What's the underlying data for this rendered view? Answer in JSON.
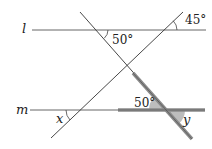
{
  "diagram": {
    "title": "",
    "colors": {
      "line": "#333333",
      "thin_line": "#555555",
      "highlight": "#888888",
      "shade": "#b8b8b8",
      "text": "#222222",
      "background": "#ffffff"
    },
    "lines": {
      "l": {
        "label": "l",
        "y": 30,
        "x1": 32,
        "x2": 206
      },
      "m": {
        "label": "m",
        "y": 110,
        "x1": 30,
        "x2": 205
      }
    },
    "transversals": [
      {
        "name": "descending",
        "x1": 80,
        "y1": 12,
        "x2": 192,
        "y2": 139
      },
      {
        "name": "ascending",
        "x1": 51,
        "y1": 138,
        "x2": 183,
        "y2": 12
      }
    ],
    "highlighted_segments": [
      {
        "name": "descending-thick",
        "x1": 133,
        "y1": 73,
        "x2": 192,
        "y2": 139
      },
      {
        "name": "horizontal-thick",
        "x1": 118,
        "y1": 110,
        "x2": 205,
        "y2": 110
      }
    ],
    "angle_labels": {
      "top_left_angle": "50°",
      "top_right_angle": "45°",
      "bottom_middle_angle": "50°",
      "x_angle": "x",
      "y_angle": "y"
    },
    "line_labels": {
      "l": "l",
      "m": "m"
    }
  }
}
